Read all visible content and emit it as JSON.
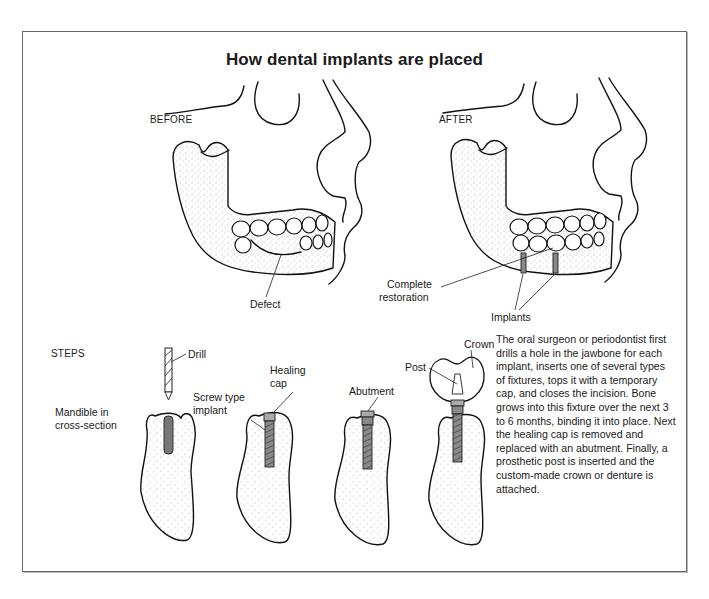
{
  "figure": {
    "title": "How dental implants are placed",
    "panels": {
      "before": {
        "label": "BEFORE",
        "callouts": {
          "defect": "Defect"
        }
      },
      "after": {
        "label": "AFTER",
        "callouts": {
          "restoration_line1": "Complete",
          "restoration_line2": "restoration",
          "implants": "Implants"
        }
      }
    },
    "steps": {
      "heading": "STEPS",
      "labels": {
        "drill": "Drill",
        "mandible_line1": "Mandible in",
        "mandible_line2": "cross-section",
        "screw_line1": "Screw type",
        "screw_line2": "implant",
        "healing_line1": "Healing",
        "healing_line2": "cap",
        "abutment": "Abutment",
        "post": "Post",
        "crown": "Crown"
      }
    },
    "description": "The oral surgeon or periodontist first drills a hole in the jawbone for each implant, inserts one of several types of fixtures, tops it with a temporary cap, and closes the incision. Bone grows into this fixture over the next 3 to 6 months, binding it into place. Next the healing cap is removed and replaced with an abutment. Finally, a prosthetic post is inserted and the custom-made crown or denture is attached."
  }
}
